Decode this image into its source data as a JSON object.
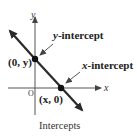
{
  "diagram": {
    "caption": "Intercepts",
    "axes": {
      "x_label": "x",
      "y_label": "y",
      "origin_label": "O"
    },
    "points": [
      {
        "label": "(0, y)",
        "name": "y-intercept"
      },
      {
        "label": "(x, 0)",
        "name": "x-intercept"
      }
    ],
    "annotations": {
      "y_intercept_prefix": "y",
      "y_intercept_suffix": "-intercept",
      "x_intercept_prefix": "x",
      "x_intercept_suffix": "-intercept"
    },
    "colors": {
      "line": "#2a2a2a",
      "axis": "#444444",
      "point": "#111111"
    }
  }
}
